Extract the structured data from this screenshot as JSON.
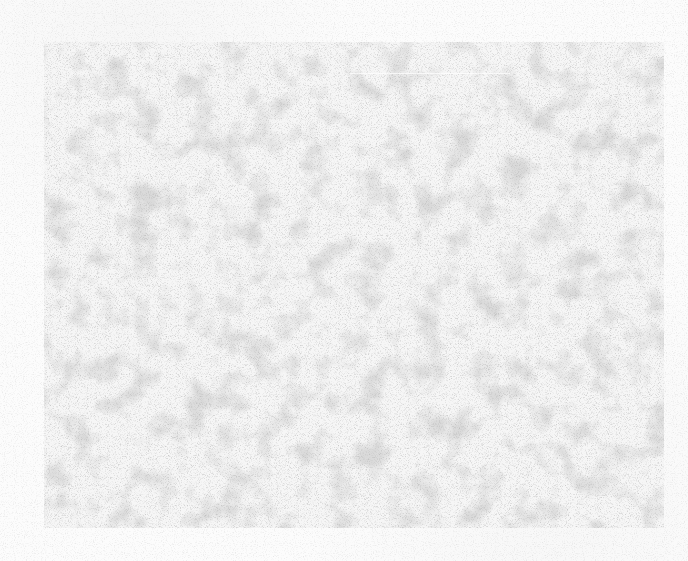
{
  "canvas": {
    "background_color": "#fcfcfc",
    "panel_color": "#f4f4f4",
    "texture": "gray-speckled-noise"
  }
}
